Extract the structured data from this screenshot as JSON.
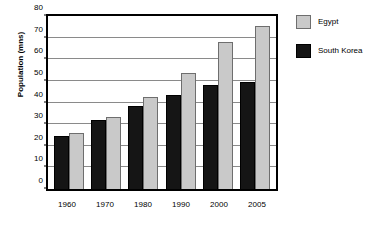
{
  "chart_data": {
    "type": "bar",
    "title": "",
    "xlabel": "",
    "ylabel": "Population (mns)",
    "categories": [
      "1960",
      "1970",
      "1980",
      "1990",
      "2000",
      "2005"
    ],
    "series": [
      {
        "name": "South Korea",
        "color": "#151515",
        "values": [
          24.5,
          32,
          38.5,
          43.5,
          48,
          49.5
        ]
      },
      {
        "name": "Egypt",
        "color": "#c9c9c9",
        "values": [
          26,
          33.5,
          42.5,
          53.5,
          68,
          75.5
        ]
      }
    ],
    "series_draw_order": [
      "South Korea",
      "Egypt"
    ],
    "ylim": [
      0,
      80
    ],
    "ytick_values": [
      0,
      10,
      20,
      30,
      40,
      50,
      60,
      70,
      80
    ],
    "ytick_labels": [
      "0",
      "10",
      "20",
      "30",
      "40",
      "50",
      "60",
      "70",
      "80"
    ],
    "grid": true,
    "grid_color": "#8a8a8a",
    "legend_position": "right",
    "legend_entries": [
      {
        "label": "Egypt",
        "color": "#c9c9c9",
        "swatch": "legend-swatch-egypt"
      },
      {
        "label": "South Korea",
        "color": "#151515",
        "swatch": "legend-swatch-south-korea"
      }
    ],
    "frame_color": "#000000",
    "background": "#ffffff"
  }
}
